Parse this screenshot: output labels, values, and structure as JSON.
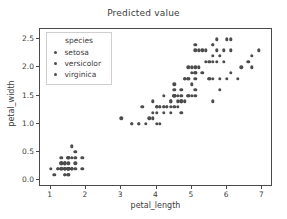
{
  "chart_data": {
    "type": "scatter",
    "title": "Predicted value",
    "xlabel": "petal_length",
    "ylabel": "petal_width",
    "xlim": [
      0.7,
      7.3
    ],
    "ylim": [
      -0.12,
      2.68
    ],
    "xticks": [
      "1",
      "2",
      "3",
      "4",
      "5",
      "6",
      "7"
    ],
    "xtick_values": [
      1,
      2,
      3,
      4,
      5,
      6,
      7
    ],
    "yticks": [
      "0.0",
      "0.5",
      "1.0",
      "1.5",
      "2.0",
      "2.5"
    ],
    "ytick_values": [
      0.0,
      0.5,
      1.0,
      1.5,
      2.0,
      2.5
    ],
    "grid": false,
    "marker_color": "#4c4c4c",
    "legend": {
      "title": "species",
      "position": "upper-left-inside",
      "entries": [
        {
          "label": "setosa",
          "color": "#4c4c4c"
        },
        {
          "label": "versicolor",
          "color": "#4c4c4c"
        },
        {
          "label": "virginica",
          "color": "#4c4c4c"
        }
      ]
    },
    "series": [
      {
        "name": "setosa",
        "color": "#4c4c4c",
        "points": [
          [
            1.4,
            0.2
          ],
          [
            1.4,
            0.2
          ],
          [
            1.3,
            0.2
          ],
          [
            1.5,
            0.2
          ],
          [
            1.4,
            0.2
          ],
          [
            1.7,
            0.4
          ],
          [
            1.4,
            0.3
          ],
          [
            1.5,
            0.2
          ],
          [
            1.4,
            0.2
          ],
          [
            1.5,
            0.1
          ],
          [
            1.5,
            0.2
          ],
          [
            1.6,
            0.2
          ],
          [
            1.4,
            0.1
          ],
          [
            1.1,
            0.1
          ],
          [
            1.2,
            0.2
          ],
          [
            1.5,
            0.4
          ],
          [
            1.3,
            0.4
          ],
          [
            1.4,
            0.3
          ],
          [
            1.7,
            0.3
          ],
          [
            1.5,
            0.3
          ],
          [
            1.7,
            0.2
          ],
          [
            1.5,
            0.4
          ],
          [
            1.0,
            0.2
          ],
          [
            1.7,
            0.5
          ],
          [
            1.9,
            0.2
          ],
          [
            1.6,
            0.2
          ],
          [
            1.6,
            0.4
          ],
          [
            1.5,
            0.2
          ],
          [
            1.4,
            0.2
          ],
          [
            1.6,
            0.2
          ],
          [
            1.6,
            0.2
          ],
          [
            1.5,
            0.4
          ],
          [
            1.5,
            0.1
          ],
          [
            1.4,
            0.2
          ],
          [
            1.5,
            0.2
          ],
          [
            1.2,
            0.2
          ],
          [
            1.3,
            0.2
          ],
          [
            1.4,
            0.1
          ],
          [
            1.3,
            0.2
          ],
          [
            1.5,
            0.2
          ],
          [
            1.3,
            0.3
          ],
          [
            1.3,
            0.3
          ],
          [
            1.3,
            0.2
          ],
          [
            1.6,
            0.6
          ],
          [
            1.9,
            0.4
          ],
          [
            1.4,
            0.3
          ],
          [
            1.6,
            0.2
          ],
          [
            1.4,
            0.2
          ],
          [
            1.5,
            0.2
          ],
          [
            1.4,
            0.2
          ]
        ]
      },
      {
        "name": "versicolor",
        "color": "#4c4c4c",
        "points": [
          [
            4.7,
            1.4
          ],
          [
            4.5,
            1.5
          ],
          [
            4.9,
            1.5
          ],
          [
            4.0,
            1.3
          ],
          [
            4.6,
            1.5
          ],
          [
            4.5,
            1.3
          ],
          [
            4.7,
            1.6
          ],
          [
            3.3,
            1.0
          ],
          [
            4.6,
            1.3
          ],
          [
            3.9,
            1.4
          ],
          [
            3.5,
            1.0
          ],
          [
            4.2,
            1.5
          ],
          [
            4.0,
            1.0
          ],
          [
            4.7,
            1.4
          ],
          [
            3.6,
            1.3
          ],
          [
            4.4,
            1.4
          ],
          [
            4.5,
            1.5
          ],
          [
            4.1,
            1.0
          ],
          [
            4.5,
            1.5
          ],
          [
            3.9,
            1.1
          ],
          [
            4.8,
            1.8
          ],
          [
            4.0,
            1.3
          ],
          [
            4.9,
            1.5
          ],
          [
            4.7,
            1.2
          ],
          [
            4.3,
            1.3
          ],
          [
            4.4,
            1.4
          ],
          [
            4.8,
            1.4
          ],
          [
            5.0,
            1.7
          ],
          [
            4.5,
            1.5
          ],
          [
            3.5,
            1.0
          ],
          [
            3.8,
            1.1
          ],
          [
            3.7,
            1.0
          ],
          [
            3.9,
            1.2
          ],
          [
            5.1,
            1.6
          ],
          [
            4.5,
            1.5
          ],
          [
            4.5,
            1.6
          ],
          [
            4.7,
            1.5
          ],
          [
            4.4,
            1.3
          ],
          [
            4.1,
            1.3
          ],
          [
            4.0,
            1.3
          ],
          [
            4.4,
            1.2
          ],
          [
            4.6,
            1.4
          ],
          [
            4.0,
            1.2
          ],
          [
            3.3,
            1.0
          ],
          [
            4.2,
            1.3
          ],
          [
            4.2,
            1.2
          ],
          [
            4.2,
            1.3
          ],
          [
            4.3,
            1.3
          ],
          [
            3.0,
            1.1
          ],
          [
            4.1,
            1.3
          ]
        ]
      },
      {
        "name": "virginica",
        "color": "#4c4c4c",
        "points": [
          [
            6.0,
            2.5
          ],
          [
            5.1,
            1.9
          ],
          [
            5.9,
            2.1
          ],
          [
            5.6,
            1.8
          ],
          [
            5.8,
            2.2
          ],
          [
            6.6,
            2.1
          ],
          [
            4.5,
            1.7
          ],
          [
            6.3,
            1.8
          ],
          [
            5.8,
            1.8
          ],
          [
            6.1,
            2.5
          ],
          [
            5.1,
            2.0
          ],
          [
            5.3,
            1.9
          ],
          [
            5.5,
            2.1
          ],
          [
            5.0,
            2.0
          ],
          [
            5.1,
            2.4
          ],
          [
            5.3,
            2.3
          ],
          [
            5.5,
            1.8
          ],
          [
            6.7,
            2.2
          ],
          [
            6.9,
            2.3
          ],
          [
            5.0,
            1.5
          ],
          [
            5.7,
            2.3
          ],
          [
            4.9,
            2.0
          ],
          [
            6.7,
            2.0
          ],
          [
            4.9,
            1.8
          ],
          [
            5.7,
            2.1
          ],
          [
            6.0,
            1.8
          ],
          [
            4.8,
            1.8
          ],
          [
            4.9,
            1.8
          ],
          [
            5.6,
            2.1
          ],
          [
            5.8,
            1.6
          ],
          [
            6.1,
            1.9
          ],
          [
            6.4,
            2.0
          ],
          [
            5.6,
            2.2
          ],
          [
            5.1,
            1.5
          ],
          [
            5.6,
            1.4
          ],
          [
            6.1,
            2.3
          ],
          [
            5.6,
            2.4
          ],
          [
            5.5,
            1.8
          ],
          [
            4.8,
            1.8
          ],
          [
            5.4,
            2.1
          ],
          [
            5.6,
            2.4
          ],
          [
            5.1,
            2.3
          ],
          [
            5.1,
            1.9
          ],
          [
            5.9,
            2.3
          ],
          [
            5.7,
            2.5
          ],
          [
            5.2,
            2.3
          ],
          [
            5.0,
            1.9
          ],
          [
            5.2,
            2.0
          ],
          [
            5.4,
            2.3
          ],
          [
            5.1,
            1.8
          ]
        ]
      }
    ]
  }
}
